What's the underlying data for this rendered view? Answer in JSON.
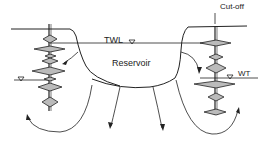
{
  "diagram": {
    "labels": {
      "twl": "TWL",
      "reservoir": "Reservoir",
      "wt": "WT",
      "cutoff": "Cut-off"
    },
    "colors": {
      "line": "#222222",
      "fill": "#bbbbbb",
      "background": "#ffffff"
    }
  }
}
